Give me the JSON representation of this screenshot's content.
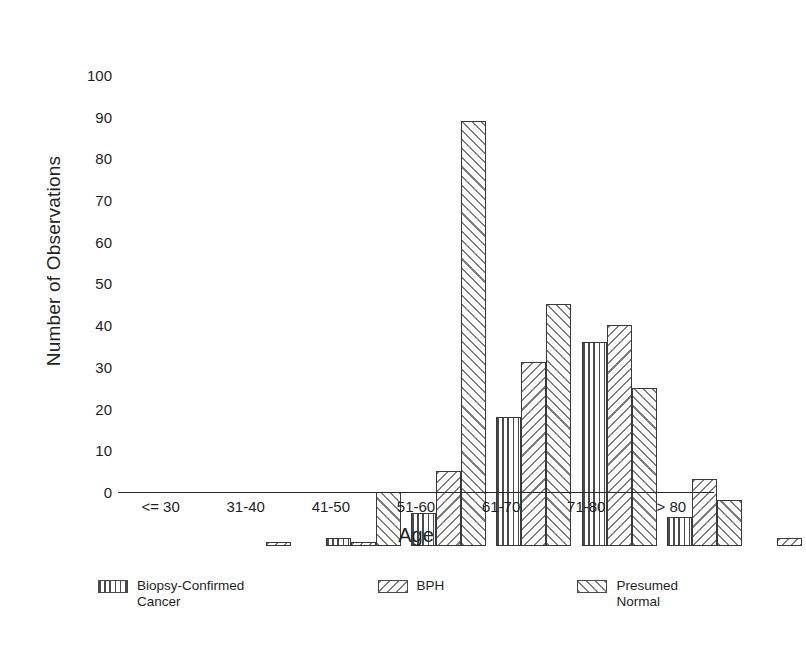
{
  "chart_data": {
    "type": "bar",
    "title": "",
    "xlabel": "Age",
    "ylabel": "Number of Observations",
    "ylim": [
      0,
      105
    ],
    "yticks": [
      0,
      10,
      20,
      30,
      40,
      50,
      60,
      70,
      80,
      90,
      100
    ],
    "grid": false,
    "legend_position": "bottom",
    "categories": [
      "<= 30",
      "31-40",
      "41-50",
      "51-60",
      "61-70",
      "71-80",
      "> 80"
    ],
    "series": [
      {
        "name": "Biopsy-Confirmed\nCancer",
        "pattern": "vertical-lines",
        "values": [
          0,
          2,
          8,
          31,
          49,
          7,
          0
        ]
      },
      {
        "name": "BPH",
        "pattern": "backslash-hatch",
        "values": [
          1,
          1,
          18,
          44,
          53,
          16,
          2
        ]
      },
      {
        "name": "Presumed\nNormal",
        "pattern": "forwardslash-hatch",
        "values": [
          0,
          13,
          102,
          58,
          38,
          11,
          0
        ]
      }
    ]
  },
  "axes": {
    "y_title": "Number of Observations",
    "x_title": "Age",
    "y_tick_labels": [
      "100",
      "90",
      "80",
      "70",
      "60",
      "50",
      "40",
      "30",
      "20",
      "10",
      "0"
    ],
    "x_tick_labels": [
      "<= 30",
      "31-40",
      "41-50",
      "51-60",
      "61-70",
      "71-80",
      "> 80"
    ]
  },
  "legend": {
    "entries": [
      {
        "label": "Biopsy-Confirmed\nCancer",
        "pattern": "vertical-lines"
      },
      {
        "label": "BPH",
        "pattern": "backslash-hatch"
      },
      {
        "label": "Presumed\nNormal",
        "pattern": "forwardslash-hatch"
      }
    ]
  },
  "colors": {
    "axis": "#2a2a2a",
    "text": "#1e1e1e",
    "hatch_dark": "#4a4a4a",
    "hatch_light": "#7e7e7e",
    "background": "#ffffff"
  }
}
